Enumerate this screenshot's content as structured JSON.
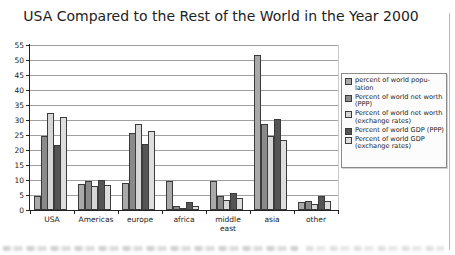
{
  "chart_data": {
    "type": "bar",
    "title": "USA Compared to the Rest of the World in the Year 2000",
    "categories": [
      "USA",
      "Americas",
      "europe",
      "africa",
      "middle east",
      "asia",
      "other"
    ],
    "series": [
      {
        "name": "percent of world popu-lation",
        "color": "#a9a9a9",
        "values": [
          4.7,
          8.7,
          8.9,
          9.7,
          9.5,
          51.7,
          2.5
        ]
      },
      {
        "name": "Percent of world net worth (PPP)",
        "color": "#8a8a8a",
        "values": [
          24.7,
          9.7,
          25.8,
          1.2,
          4.7,
          28.8,
          3.0
        ]
      },
      {
        "name": "Percent of world net worth (exchange rates)",
        "color": "#d6d6d6",
        "values": [
          32.3,
          8.0,
          28.6,
          0.8,
          3.3,
          24.8,
          2.0
        ]
      },
      {
        "name": "Percent of world GDP (PPP)",
        "color": "#555555",
        "values": [
          21.7,
          10.0,
          21.9,
          2.5,
          5.8,
          30.2,
          4.5
        ]
      },
      {
        "name": "Percent of world GDP (exchange rates)",
        "color": "#dedede",
        "values": [
          31.0,
          8.3,
          26.3,
          1.3,
          4.1,
          23.3,
          3.0
        ]
      }
    ],
    "ylim": [
      0,
      55
    ],
    "yticks": [
      0,
      5,
      10,
      15,
      20,
      25,
      30,
      35,
      40,
      45,
      50,
      55
    ],
    "grid": true,
    "legend_position": "right"
  }
}
